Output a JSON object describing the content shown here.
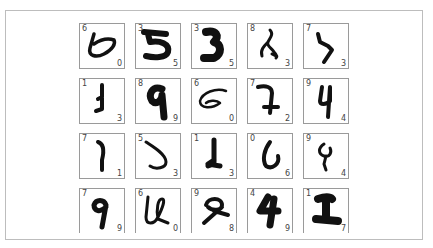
{
  "grid": {
    "rows": 4,
    "cols": 5,
    "tiles": [
      {
        "true_label": "6",
        "pred_label": "0",
        "glyph": "g6a"
      },
      {
        "true_label": "3",
        "pred_label": "5",
        "glyph": "g5bold"
      },
      {
        "true_label": "3",
        "pred_label": "5",
        "glyph": "g3bold"
      },
      {
        "true_label": "8",
        "pred_label": "3",
        "glyph": "g8open"
      },
      {
        "true_label": "7",
        "pred_label": "3",
        "glyph": "g7hook"
      },
      {
        "true_label": "1",
        "pred_label": "3",
        "glyph": "g1foot"
      },
      {
        "true_label": "8",
        "pred_label": "9",
        "glyph": "g9bold"
      },
      {
        "true_label": "6",
        "pred_label": "0",
        "glyph": "g6loop"
      },
      {
        "true_label": "7",
        "pred_label": "2",
        "glyph": "g7cross"
      },
      {
        "true_label": "9",
        "pred_label": "4",
        "glyph": "g4thin"
      },
      {
        "true_label": "7",
        "pred_label": "1",
        "glyph": "g1curve"
      },
      {
        "true_label": "5",
        "pred_label": "3",
        "glyph": "g5hook"
      },
      {
        "true_label": "1",
        "pred_label": "3",
        "glyph": "g1base"
      },
      {
        "true_label": "0",
        "pred_label": "6",
        "glyph": "g0open"
      },
      {
        "true_label": "9",
        "pred_label": "4",
        "glyph": "g4curly"
      },
      {
        "true_label": "7",
        "pred_label": "9",
        "glyph": "g7nine"
      },
      {
        "true_label": "6",
        "pred_label": "0",
        "glyph": "g6u"
      },
      {
        "true_label": "9",
        "pred_label": "8",
        "glyph": "g9loop"
      },
      {
        "true_label": "4",
        "pred_label": "9",
        "glyph": "g4bold"
      },
      {
        "true_label": "1",
        "pred_label": "7",
        "glyph": "g1bold"
      }
    ]
  },
  "colors": {
    "ink": "#111111",
    "label": "#444444",
    "tile_border": "#9a9a9a",
    "frame_border": "#bdbdbd"
  }
}
